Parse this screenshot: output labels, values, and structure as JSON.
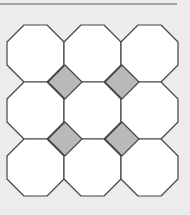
{
  "diagram": {
    "type": "octagon-square tessellation",
    "rows": 3,
    "cols": 3,
    "cell_size": 57,
    "origin": [
      7,
      25
    ],
    "corner_cut": 17,
    "diamonds": [
      [
        65,
        82
      ],
      [
        122,
        82
      ],
      [
        65,
        139
      ],
      [
        122,
        139
      ]
    ],
    "colors": {
      "background": "#ececec",
      "octagon_fill": "#ffffff",
      "diamond_fill": "#b9b9b9",
      "stroke": "#444444",
      "top_rule": "#8a8a8a"
    }
  }
}
